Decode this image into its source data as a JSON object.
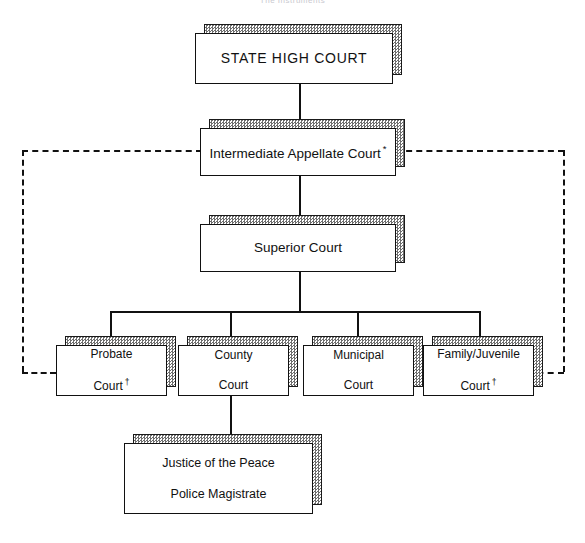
{
  "diagram": {
    "title_fragment": "The Instruments",
    "type": "court-system-hierarchy",
    "nodes": {
      "state_high_court": {
        "label": "STATE HIGH COURT"
      },
      "intermediate_appellate": {
        "label": "Intermediate Appellate Court",
        "marker": "*"
      },
      "superior_court": {
        "label": "Superior Court"
      },
      "probate_court": {
        "line1": "Probate",
        "line2": "Court",
        "marker": "†"
      },
      "county_court": {
        "line1": "County",
        "line2": "Court",
        "marker": ""
      },
      "municipal_court": {
        "line1": "Municipal",
        "line2": "Court",
        "marker": ""
      },
      "family_juvenile_court": {
        "line1": "Family/Juvenile",
        "line2": "Court",
        "marker": "†"
      },
      "justice_of_peace": {
        "line1": "Justice of the Peace",
        "line2": "Police Magistrate"
      }
    },
    "colors": {
      "ink": "#111111",
      "shadow_gray": "#6e6e6e",
      "paper": "#ffffff"
    }
  }
}
